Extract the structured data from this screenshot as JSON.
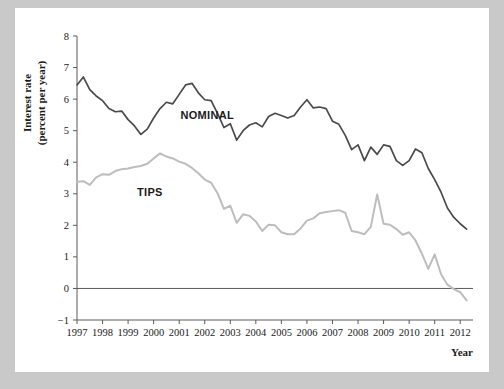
{
  "chart_data": {
    "type": "line",
    "title": "",
    "xlabel": "Year",
    "ylabel": "Interest rate (percent per year)",
    "ylabel_line1": "Interest rate",
    "ylabel_line2": "(percent per year)",
    "xlim": [
      1997,
      2012.5
    ],
    "ylim": [
      -1,
      8
    ],
    "ytick_values": [
      -1,
      0,
      1,
      2,
      3,
      4,
      5,
      6,
      7,
      8
    ],
    "ytick_labels": [
      "−1",
      "0",
      "1",
      "2",
      "3",
      "4",
      "5",
      "6",
      "7",
      "8"
    ],
    "xtick_values": [
      1997,
      1998,
      1999,
      2000,
      2001,
      2002,
      2003,
      2004,
      2005,
      2006,
      2007,
      2008,
      2009,
      2010,
      2011,
      2012
    ],
    "xtick_labels": [
      "1997",
      "1998",
      "1999",
      "2000",
      "2001",
      "2002",
      "2003",
      "2004",
      "2005",
      "2006",
      "2007",
      "2008",
      "2009",
      "2010",
      "2011",
      "2012"
    ],
    "grid": false,
    "legend_position": "inline-annotation",
    "zero_line": 0,
    "series": [
      {
        "name": "NOMINAL",
        "color": "#4a4a4a",
        "label_x": 2001.05,
        "label_y": 5.38,
        "x": [
          1997.0,
          1997.25,
          1997.5,
          1997.75,
          1998.0,
          1998.25,
          1998.5,
          1998.75,
          1999.0,
          1999.25,
          1999.5,
          1999.75,
          2000.0,
          2000.25,
          2000.5,
          2000.75,
          2001.0,
          2001.25,
          2001.5,
          2001.75,
          2002.0,
          2002.25,
          2002.5,
          2002.75,
          2003.0,
          2003.25,
          2003.5,
          2003.75,
          2004.0,
          2004.25,
          2004.5,
          2004.75,
          2005.0,
          2005.25,
          2005.5,
          2005.75,
          2006.0,
          2006.25,
          2006.5,
          2006.75,
          2007.0,
          2007.25,
          2007.5,
          2007.75,
          2008.0,
          2008.25,
          2008.5,
          2008.75,
          2009.0,
          2009.25,
          2009.5,
          2009.75,
          2010.0,
          2010.25,
          2010.5,
          2010.75,
          2011.0,
          2011.25,
          2011.5,
          2011.75,
          2012.0,
          2012.25
        ],
        "values": [
          6.45,
          6.7,
          6.3,
          6.1,
          5.95,
          5.7,
          5.6,
          5.62,
          5.35,
          5.15,
          4.88,
          5.05,
          5.4,
          5.7,
          5.9,
          5.85,
          6.15,
          6.45,
          6.5,
          6.2,
          5.98,
          5.95,
          5.55,
          5.1,
          5.22,
          4.7,
          5.0,
          5.18,
          5.25,
          5.12,
          5.45,
          5.55,
          5.48,
          5.4,
          5.48,
          5.75,
          5.98,
          5.72,
          5.75,
          5.7,
          5.3,
          5.2,
          4.85,
          4.4,
          4.55,
          4.05,
          4.48,
          4.25,
          4.55,
          4.5,
          4.05,
          3.9,
          4.05,
          4.42,
          4.3,
          3.8,
          3.45,
          3.05,
          2.55,
          2.25,
          2.05,
          1.88
        ]
      },
      {
        "name": "TIPS",
        "color": "#bdbdbd",
        "label_x": 1999.35,
        "label_y": 2.92,
        "x": [
          1997.0,
          1997.25,
          1997.5,
          1997.75,
          1998.0,
          1998.25,
          1998.5,
          1998.75,
          1999.0,
          1999.25,
          1999.5,
          1999.75,
          2000.0,
          2000.25,
          2000.5,
          2000.75,
          2001.0,
          2001.25,
          2001.5,
          2001.75,
          2002.0,
          2002.25,
          2002.5,
          2002.75,
          2003.0,
          2003.25,
          2003.5,
          2003.75,
          2004.0,
          2004.25,
          2004.5,
          2004.75,
          2005.0,
          2005.25,
          2005.5,
          2005.75,
          2006.0,
          2006.25,
          2006.5,
          2006.75,
          2007.0,
          2007.25,
          2007.5,
          2007.75,
          2008.0,
          2008.25,
          2008.5,
          2008.75,
          2009.0,
          2009.25,
          2009.5,
          2009.75,
          2010.0,
          2010.25,
          2010.5,
          2010.75,
          2011.0,
          2011.25,
          2011.5,
          2011.75,
          2012.0,
          2012.25
        ],
        "values": [
          3.38,
          3.4,
          3.28,
          3.52,
          3.62,
          3.6,
          3.72,
          3.78,
          3.8,
          3.85,
          3.88,
          3.95,
          4.12,
          4.28,
          4.18,
          4.12,
          4.02,
          3.95,
          3.82,
          3.65,
          3.45,
          3.35,
          3.02,
          2.52,
          2.62,
          2.08,
          2.35,
          2.3,
          2.12,
          1.82,
          2.02,
          2.0,
          1.78,
          1.72,
          1.72,
          1.9,
          2.15,
          2.22,
          2.38,
          2.42,
          2.45,
          2.48,
          2.4,
          1.82,
          1.78,
          1.72,
          1.95,
          2.98,
          2.05,
          2.02,
          1.88,
          1.7,
          1.78,
          1.52,
          1.1,
          0.62,
          1.08,
          0.45,
          0.12,
          -0.02,
          -0.12,
          -0.38
        ]
      }
    ]
  }
}
